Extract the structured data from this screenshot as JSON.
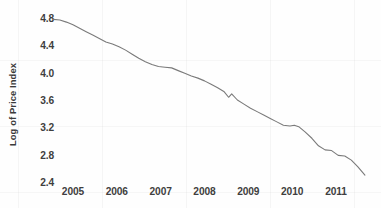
{
  "chart_data": {
    "type": "line",
    "title": "",
    "subtitle": "",
    "xlabel": "",
    "ylabel": "Log of Price Index",
    "xlim": [
      2004.55,
      2011.75
    ],
    "ylim": [
      2.4,
      4.8
    ],
    "yticks": [
      "4.8",
      "4.4",
      "4.0",
      "3.6",
      "3.2",
      "2.8",
      "2.4"
    ],
    "ytick_values": [
      4.8,
      4.4,
      4.0,
      3.6,
      3.2,
      2.8,
      2.4
    ],
    "xticks": [
      "2005",
      "2006",
      "2007",
      "2008",
      "2009",
      "2010",
      "2011"
    ],
    "xtick_values": [
      2005,
      2006,
      2007,
      2008,
      2009,
      2010,
      2011
    ],
    "grid": false,
    "legend": null,
    "legend_position": "none",
    "series": [
      {
        "name": "Log of Price Index",
        "color": "#7a7a7a",
        "line_width": 1.1,
        "x": [
          2004.55,
          2004.7,
          2004.85,
          2005.0,
          2005.15,
          2005.3,
          2005.45,
          2005.6,
          2005.75,
          2005.9,
          2006.05,
          2006.2,
          2006.35,
          2006.5,
          2006.65,
          2006.8,
          2006.95,
          2007.1,
          2007.25,
          2007.4,
          2007.55,
          2007.7,
          2007.85,
          2008.0,
          2008.15,
          2008.3,
          2008.45,
          2008.55,
          2008.62,
          2008.75,
          2008.9,
          2009.05,
          2009.2,
          2009.35,
          2009.5,
          2009.65,
          2009.8,
          2009.95,
          2010.05,
          2010.15,
          2010.3,
          2010.45,
          2010.6,
          2010.75,
          2010.9,
          2011.05,
          2011.2,
          2011.35,
          2011.5,
          2011.66
        ],
        "y": [
          4.78,
          4.77,
          4.74,
          4.7,
          4.65,
          4.6,
          4.55,
          4.5,
          4.45,
          4.42,
          4.38,
          4.33,
          4.27,
          4.21,
          4.16,
          4.12,
          4.09,
          4.08,
          4.07,
          4.03,
          3.99,
          3.95,
          3.92,
          3.88,
          3.83,
          3.78,
          3.72,
          3.64,
          3.69,
          3.6,
          3.54,
          3.48,
          3.43,
          3.38,
          3.33,
          3.28,
          3.23,
          3.22,
          3.23,
          3.21,
          3.13,
          3.04,
          2.93,
          2.87,
          2.86,
          2.79,
          2.78,
          2.72,
          2.62,
          2.5
        ]
      }
    ]
  },
  "axis": {
    "y_label": "Log of Price Index",
    "y_ticks": [
      "4.8",
      "4.4",
      "4.0",
      "3.6",
      "3.2",
      "2.8",
      "2.4"
    ],
    "x_ticks": [
      "2005",
      "2006",
      "2007",
      "2008",
      "2009",
      "2010",
      "2011"
    ]
  },
  "colors": {
    "line": "#7a7a7a",
    "text": "#3f3f3f",
    "background": "#fefefe"
  }
}
